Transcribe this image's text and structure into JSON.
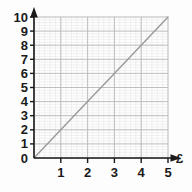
{
  "chart_data": {
    "type": "line",
    "title": "",
    "subtitle": "",
    "xlabel": "£",
    "ylabel": "",
    "xlim": [
      0,
      5
    ],
    "ylim": [
      0,
      10
    ],
    "x_ticks": [
      "0",
      "1",
      "2",
      "3",
      "4",
      "5"
    ],
    "y_ticks": [
      "0",
      "1",
      "2",
      "3",
      "4",
      "5",
      "6",
      "7",
      "8",
      "9",
      "10"
    ],
    "x_tick_values": [
      0,
      1,
      2,
      3,
      4,
      5
    ],
    "y_tick_values": [
      0,
      1,
      2,
      3,
      4,
      5,
      6,
      7,
      8,
      9,
      10
    ],
    "grid": true,
    "minor_grid": true,
    "minor_divisions": 5,
    "legend": "none",
    "annotations": [],
    "series": [
      {
        "name": "conversion-line",
        "relation": "y = 2x",
        "x": [
          0,
          1,
          2,
          3,
          4,
          5
        ],
        "values": [
          0,
          2,
          4,
          6,
          8,
          10
        ],
        "color": "#9a9a9a"
      }
    ]
  },
  "axes": {
    "x_axis_name": "x-axis",
    "y_axis_name": "y-axis",
    "x_arrow": "arrow-right",
    "y_arrow": "arrow-up",
    "axis_color": "#1a1a1a"
  },
  "style": {
    "background": "#fdfdfd",
    "plot_background": "#fefefe",
    "major_grid_color": "#b9b9b9",
    "minor_grid_color": "#e8e8e8",
    "line_color": "#9a9a9a",
    "text_color": "#1a1a1a"
  }
}
